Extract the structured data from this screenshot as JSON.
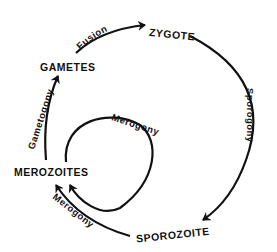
{
  "diagram": {
    "type": "life-cycle",
    "stages": {
      "zygote": "ZYGOTE",
      "gametes": "GAMETES",
      "merozoites": "MEROZOITES",
      "sporozoite": "SPOROZOITE"
    },
    "processes": {
      "fusion": "Fusion",
      "sporogony": "Sporogony",
      "merogony_outer": "Merogony",
      "merogony_inner": "Merogony",
      "gametogony": "Gametogony"
    },
    "edges": [
      {
        "from": "GAMETES",
        "to": "ZYGOTE",
        "label": "Fusion"
      },
      {
        "from": "ZYGOTE",
        "to": "SPOROZOITE",
        "label": "Sporogony"
      },
      {
        "from": "SPOROZOITE",
        "to": "MEROZOITES",
        "label": "Merogony"
      },
      {
        "from": "MEROZOITES",
        "to": "MEROZOITES",
        "label": "Merogony"
      },
      {
        "from": "MEROZOITES",
        "to": "GAMETES",
        "label": "Gametogony"
      }
    ]
  }
}
